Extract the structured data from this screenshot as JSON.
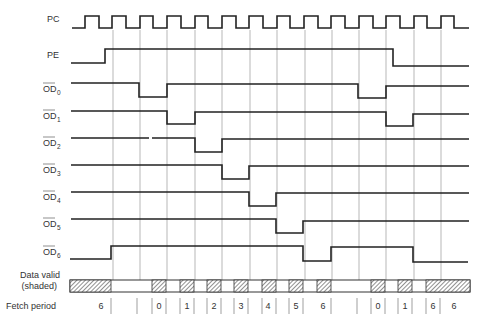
{
  "diagram": {
    "gridlines_x": [
      113,
      140,
      167,
      195,
      222,
      250,
      277,
      305,
      332,
      359,
      386,
      414,
      441
    ],
    "signals": [
      {
        "id": "pc",
        "label": "PC",
        "overbar": false,
        "subscript": "",
        "y_label": 22
      },
      {
        "id": "pe",
        "label": "PE",
        "overbar": false,
        "subscript": "",
        "y_label": 55
      },
      {
        "id": "od0",
        "label": "OD",
        "overbar": true,
        "subscript": "0",
        "y_label": 90
      },
      {
        "id": "od1",
        "label": "OD",
        "overbar": true,
        "subscript": "1",
        "y_label": 117
      },
      {
        "id": "od2",
        "label": "OD",
        "overbar": true,
        "subscript": "2",
        "y_label": 144
      },
      {
        "id": "od3",
        "label": "OD",
        "overbar": true,
        "subscript": "3",
        "y_label": 171
      },
      {
        "id": "od4",
        "label": "OD",
        "overbar": true,
        "subscript": "4",
        "y_label": 198
      },
      {
        "id": "od5",
        "label": "OD",
        "overbar": true,
        "subscript": "5",
        "y_label": 225
      },
      {
        "id": "od6",
        "label": "OD",
        "overbar": true,
        "subscript": "6",
        "y_label": 253
      }
    ],
    "data_valid_label_line1": "Data valid",
    "data_valid_label_line2": "(shaded)",
    "fetch_period_label": "Fetch period",
    "fetch_periods": [
      {
        "x": 101,
        "text": "6"
      },
      {
        "x": 159,
        "text": "0"
      },
      {
        "x": 187,
        "text": "1"
      },
      {
        "x": 214,
        "text": "2"
      },
      {
        "x": 241,
        "text": "3"
      },
      {
        "x": 268,
        "text": "4"
      },
      {
        "x": 296,
        "text": "5"
      },
      {
        "x": 323,
        "text": "6"
      },
      {
        "x": 378,
        "text": "0"
      },
      {
        "x": 405,
        "text": "1"
      },
      {
        "x": 432,
        "text": "6"
      },
      {
        "x": 454,
        "text": "6"
      }
    ],
    "colors": {
      "signal": "#222222",
      "grid": "#9a9a9a",
      "hatch": "#555555"
    }
  }
}
